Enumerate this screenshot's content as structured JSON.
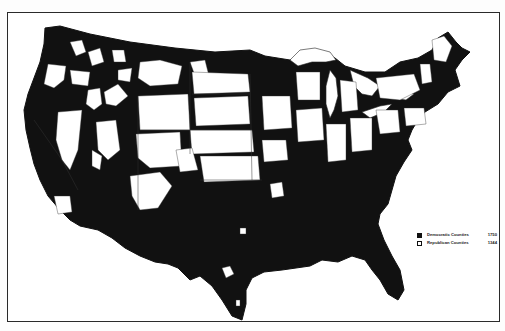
{
  "map": {
    "subject": "United States counties by party",
    "colors": {
      "democratic": "#111111",
      "republican": "#ffffff",
      "border": "#2a2a2a",
      "background": "#fdfdfd"
    }
  },
  "legend": {
    "items": [
      {
        "label": "Democratic Counties",
        "count": "1750",
        "swatch": "black"
      },
      {
        "label": "Republican Counties",
        "count": "1344",
        "swatch": "white"
      }
    ]
  }
}
